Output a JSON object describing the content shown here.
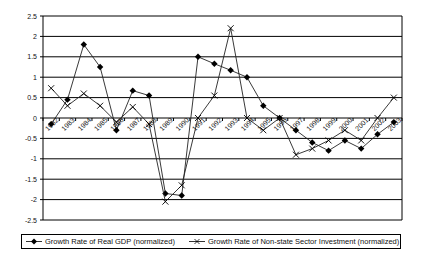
{
  "chart_data": {
    "type": "line",
    "title": "",
    "xlabel": "",
    "ylabel": "",
    "categories": [
      "1982",
      "1983",
      "1984",
      "1985",
      "1986",
      "1987",
      "1988",
      "1989",
      "1990",
      "1991",
      "1992",
      "1993",
      "1994",
      "1995",
      "1996",
      "1997",
      "1998",
      "1999",
      "2000",
      "2001",
      "2002",
      "2003"
    ],
    "series": [
      {
        "name": "Growth Rate of Real GDP (normalized)",
        "marker": "diamond",
        "values": [
          -0.15,
          0.45,
          1.8,
          1.25,
          -0.3,
          0.67,
          0.55,
          -1.85,
          -1.9,
          1.5,
          1.33,
          1.17,
          1.0,
          0.3,
          0.0,
          -0.3,
          -0.6,
          -0.8,
          -0.55,
          -0.75,
          -0.4,
          -0.1
        ]
      },
      {
        "name": "Growth Rate of Non-state Sector Investment (normalized)",
        "marker": "x",
        "values": [
          0.73,
          0.3,
          0.6,
          0.3,
          -0.1,
          0.27,
          -0.15,
          -2.05,
          -1.65,
          0.0,
          0.55,
          2.2,
          0.0,
          -0.3,
          0.0,
          -0.9,
          -0.75,
          -0.55,
          -0.3,
          -0.55,
          0.0,
          0.5
        ]
      }
    ],
    "ylim": [
      -2.5,
      2.5
    ],
    "yticks": [
      "2.5",
      "2",
      "1.5",
      "1",
      "0.5",
      "0",
      "-0.5",
      "-1",
      "-1.5",
      "-2",
      "-2.5"
    ],
    "grid": true,
    "legend_position": "bottom"
  },
  "legend": {
    "gdp_label": "Growth Rate of Real GDP (normalized)",
    "investment_label": "Growth Rate of Non-state Sector Investment (normalized)"
  }
}
